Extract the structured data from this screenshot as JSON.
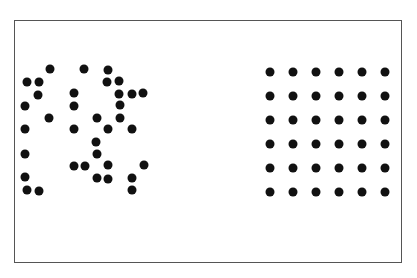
{
  "figure": {
    "frame": {
      "left": 14,
      "top": 20,
      "right": 402,
      "bottom": 263
    },
    "dot_color": "#111111",
    "dot_diameter": 9,
    "random_cluster": {
      "count": 36,
      "dots": [
        [
          50,
          69
        ],
        [
          84,
          69
        ],
        [
          108,
          70
        ],
        [
          27,
          82
        ],
        [
          39,
          82
        ],
        [
          107,
          82
        ],
        [
          119,
          81
        ],
        [
          38,
          95
        ],
        [
          74,
          93
        ],
        [
          119,
          94
        ],
        [
          132,
          94
        ],
        [
          143,
          93
        ],
        [
          25,
          106
        ],
        [
          74,
          106
        ],
        [
          120,
          105
        ],
        [
          49,
          118
        ],
        [
          97,
          118
        ],
        [
          120,
          118
        ],
        [
          25,
          129
        ],
        [
          74,
          129
        ],
        [
          108,
          129
        ],
        [
          132,
          129
        ],
        [
          96,
          142
        ],
        [
          25,
          154
        ],
        [
          97,
          154
        ],
        [
          74,
          166
        ],
        [
          85,
          166
        ],
        [
          108,
          165
        ],
        [
          144,
          165
        ],
        [
          25,
          177
        ],
        [
          97,
          178
        ],
        [
          108,
          179
        ],
        [
          132,
          178
        ],
        [
          27,
          190
        ],
        [
          39,
          191
        ],
        [
          132,
          190
        ]
      ]
    },
    "regular_grid": {
      "rows": 6,
      "cols": 6,
      "count": 36,
      "origin": [
        270,
        72
      ],
      "spacing_x": 23,
      "spacing_y": 24
    }
  }
}
